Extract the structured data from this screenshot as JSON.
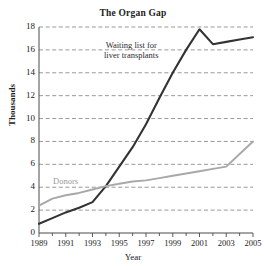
{
  "chart_data": {
    "type": "line",
    "title": "The Organ Gap",
    "xlabel": "Year",
    "ylabel": "Thousands",
    "xlim": [
      1989,
      2005
    ],
    "ylim": [
      0,
      18
    ],
    "grid": true,
    "legend_position": "inline-annotations",
    "x": [
      1989,
      1990,
      1991,
      1992,
      1993,
      1994,
      1995,
      1996,
      1997,
      1998,
      1999,
      2000,
      2001,
      2002,
      2003,
      2004,
      2005
    ],
    "xtick_labels": [
      "1989",
      "1991",
      "1993",
      "1995",
      "1997",
      "1999",
      "2001",
      "2003",
      "2005"
    ],
    "xtick_values": [
      1989,
      1991,
      1993,
      1995,
      1997,
      1999,
      2001,
      2003,
      2005
    ],
    "ytick_labels": [
      "0",
      "2",
      "4",
      "6",
      "8",
      "10",
      "12",
      "14",
      "16",
      "18"
    ],
    "ytick_values": [
      0,
      2,
      4,
      6,
      8,
      10,
      12,
      14,
      16,
      18
    ],
    "series": [
      {
        "name": "Waiting list for liver transplants",
        "color": "#333333",
        "annotation": "Waiting list for liver transplants",
        "values": [
          0.8,
          1.3,
          1.8,
          2.2,
          2.7,
          4.1,
          5.8,
          7.5,
          9.5,
          11.8,
          14.0,
          16.0,
          17.8,
          16.5,
          16.7,
          16.9,
          17.1
        ]
      },
      {
        "name": "Donors",
        "color": "#a8a8a8",
        "annotation": "Donors",
        "values": [
          2.4,
          3.0,
          3.3,
          3.5,
          3.8,
          4.1,
          4.3,
          4.5,
          4.6,
          4.8,
          5.0,
          5.2,
          5.4,
          5.6,
          5.8,
          6.9,
          8.0
        ]
      }
    ]
  },
  "colors": {
    "waiting_list_line": "#333333",
    "donors_line": "#a8a8a8",
    "gridline": "#8d8d8d",
    "axis": "#4a4a4a",
    "text": "#1c1c1c",
    "background": "#ffffff"
  }
}
